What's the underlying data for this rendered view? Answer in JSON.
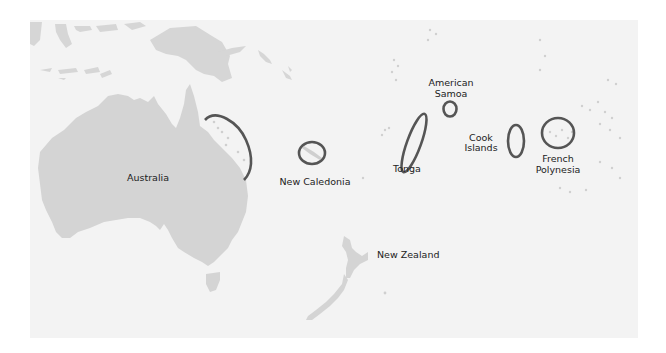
{
  "map": {
    "title": "Oceania",
    "colors": {
      "ocean": "#f3f3f3",
      "land": "#d4d4d4",
      "islands": "#c9c9c9",
      "ellipse": "#555555",
      "label": "#222222"
    },
    "labels": {
      "australia": "Australia",
      "new_caledonia": "New Caledonia",
      "tonga": "Tonga",
      "american_samoa_1": "American",
      "american_samoa_2": "Samoa",
      "cook_islands_1": "Cook",
      "cook_islands_2": "Islands",
      "french_polynesia_1": "French",
      "french_polynesia_2": "Polynesia",
      "new_zealand": "New Zealand"
    },
    "highlighted_regions": [
      "Great Barrier Reef (Australia)",
      "New Caledonia",
      "Tonga",
      "American Samoa",
      "Cook Islands",
      "French Polynesia"
    ]
  }
}
